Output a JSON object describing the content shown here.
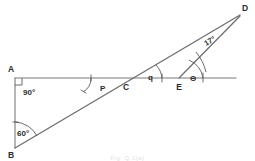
{
  "figure": {
    "caption": "Fig. Q.1(a)",
    "background_color": "#ffffff",
    "line_color": "#7a7a7a",
    "text_color": "#2b2b2b",
    "points": {
      "A": {
        "label": "A",
        "x": 15,
        "y": 78
      },
      "B": {
        "label": "B",
        "x": 15,
        "y": 150
      },
      "C": {
        "label": "C",
        "x": 126,
        "y": 78
      },
      "D": {
        "label": "D",
        "x": 240,
        "y": 12
      },
      "E": {
        "label": "E",
        "x": 179,
        "y": 78
      }
    },
    "angles": {
      "at_A": {
        "label": "90°",
        "vertex": "A",
        "marker": "right-angle-square"
      },
      "at_B": {
        "label": "60°",
        "vertex": "B",
        "marker": "arc"
      },
      "at_C_left": {
        "label": "P",
        "vertex": "C",
        "marker": "arc"
      },
      "at_C_right": {
        "label": "q",
        "vertex": "C",
        "marker": "arc"
      },
      "at_E": {
        "label": "Θ",
        "vertex": "E",
        "marker": "arc"
      },
      "at_D": {
        "label": "17°",
        "vertex": "D",
        "marker": "arc"
      }
    },
    "segments": [
      {
        "name": "segment-A-B",
        "from": "A",
        "to": "B"
      },
      {
        "name": "segment-A-horizontal-ray",
        "from": "A",
        "to": "right-edge"
      },
      {
        "name": "segment-B-D",
        "from": "B",
        "to": "D"
      },
      {
        "name": "segment-E-D",
        "from": "E",
        "to": "D"
      }
    ]
  }
}
